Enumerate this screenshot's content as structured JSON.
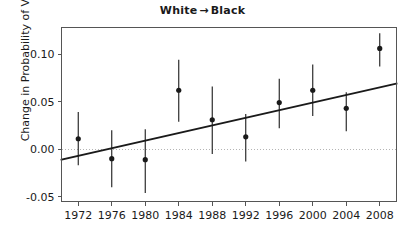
{
  "chart_data": {
    "type": "scatter",
    "title_left": "White",
    "title_arrow": "→",
    "title_right": "Black",
    "xlabel": "",
    "ylabel": "Change in Probability of Voting",
    "categories": [
      1972,
      1976,
      1980,
      1984,
      1988,
      1992,
      1996,
      2000,
      2004,
      2008
    ],
    "x_tick_labels": [
      "1972",
      "1976",
      "1980",
      "1984",
      "1988",
      "1992",
      "1996",
      "2000",
      "2004",
      "2008"
    ],
    "y_tick_labels": [
      "0.10",
      "0.05",
      "0.00",
      "-0.05"
    ],
    "y_ticks": [
      0.1,
      0.05,
      0.0,
      -0.05
    ],
    "xlim": [
      1970,
      2010
    ],
    "ylim": [
      -0.055,
      0.128
    ],
    "grid": false,
    "legend": null,
    "values": [
      0.011,
      -0.01,
      -0.011,
      0.062,
      0.031,
      0.013,
      0.049,
      0.062,
      0.043,
      0.106
    ],
    "error_low": [
      -0.017,
      -0.04,
      -0.046,
      0.029,
      -0.005,
      -0.013,
      0.022,
      0.035,
      0.019,
      0.087
    ],
    "error_high": [
      0.039,
      0.02,
      0.021,
      0.094,
      0.066,
      0.037,
      0.074,
      0.089,
      0.06,
      0.122
    ],
    "points": [
      {
        "year": 1972,
        "value": 0.011,
        "low": -0.017,
        "high": 0.039
      },
      {
        "year": 1976,
        "value": -0.01,
        "low": -0.04,
        "high": 0.02
      },
      {
        "year": 1980,
        "value": -0.011,
        "low": -0.046,
        "high": 0.021
      },
      {
        "year": 1984,
        "value": 0.062,
        "low": 0.029,
        "high": 0.094
      },
      {
        "year": 1988,
        "value": 0.031,
        "low": -0.005,
        "high": 0.066
      },
      {
        "year": 1992,
        "value": 0.013,
        "low": -0.013,
        "high": 0.037
      },
      {
        "year": 1996,
        "value": 0.049,
        "low": 0.022,
        "high": 0.074
      },
      {
        "year": 2000,
        "value": 0.062,
        "low": 0.035,
        "high": 0.089
      },
      {
        "year": 2004,
        "value": 0.043,
        "low": 0.019,
        "high": 0.06
      },
      {
        "year": 2008,
        "value": 0.106,
        "low": 0.087,
        "high": 0.122
      }
    ],
    "trend_line": {
      "x_start": 1970,
      "y_start": -0.011,
      "x_end": 2010,
      "y_end": 0.069
    },
    "zero_line": {
      "y": 0.0,
      "style": "dotted"
    },
    "colors": {
      "point": "#1a1a1a",
      "error_bar": "#1a1a1a",
      "trend_line": "#1a1a1a",
      "zero_line": "#b4b4b4",
      "frame": "#555555",
      "text": "#1a1a1a",
      "background": "#ffffff"
    }
  }
}
